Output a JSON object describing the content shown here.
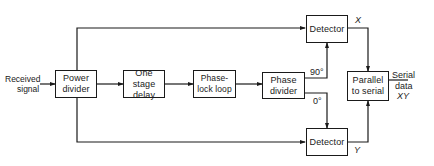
{
  "diagram": {
    "type": "block-diagram",
    "blocks": {
      "power_divider": "Power divider",
      "one_stage_delay": "One stage delay",
      "phase_lock_loop": "Phase-lock loop",
      "phase_divider": "Phase divider",
      "detector_top": "Detector",
      "detector_bottom": "Detector",
      "parallel_to_serial": "Parallel to serial"
    },
    "labels": {
      "input_line1": "Received",
      "input_line2": "signal",
      "phase_90": "90°",
      "phase_0": "0°",
      "output_x": "X",
      "output_y": "Y",
      "serial_line1": "Serial",
      "serial_line2": "data",
      "serial_line3": "XY"
    },
    "line_color": "#1a1a1a",
    "connections": [
      {
        "from": "input",
        "to": "power_divider"
      },
      {
        "from": "power_divider",
        "to": "one_stage_delay"
      },
      {
        "from": "one_stage_delay",
        "to": "phase_lock_loop"
      },
      {
        "from": "phase_lock_loop",
        "to": "phase_divider"
      },
      {
        "from": "power_divider",
        "to": "detector_top"
      },
      {
        "from": "power_divider",
        "to": "detector_bottom"
      },
      {
        "from": "phase_divider",
        "to": "detector_top",
        "label": "90°"
      },
      {
        "from": "phase_divider",
        "to": "detector_bottom",
        "label": "0°"
      },
      {
        "from": "detector_top",
        "to": "parallel_to_serial",
        "label": "X"
      },
      {
        "from": "detector_bottom",
        "to": "parallel_to_serial",
        "label": "Y"
      },
      {
        "from": "parallel_to_serial",
        "to": "output",
        "label": "Serial data XY"
      }
    ]
  }
}
